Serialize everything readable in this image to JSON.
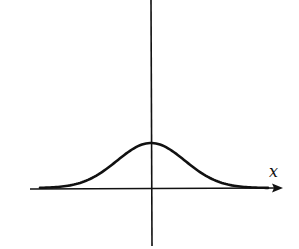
{
  "chart_data": {
    "type": "line",
    "title": "",
    "xlabel": "x",
    "ylabel": "",
    "series": [
      {
        "name": "bell curve",
        "x": [
          -3,
          -2.5,
          -2,
          -1.5,
          -1,
          -0.5,
          0,
          0.5,
          1,
          1.5,
          2,
          2.5,
          3
        ],
        "values": [
          0.01,
          0.04,
          0.14,
          0.32,
          0.61,
          0.88,
          1.0,
          0.88,
          0.61,
          0.32,
          0.14,
          0.04,
          0.01
        ]
      }
    ],
    "grid": false,
    "legend": null,
    "colors": {
      "curve": "#111111",
      "axes": "#111111"
    }
  },
  "axes": {
    "x_label": "x"
  }
}
